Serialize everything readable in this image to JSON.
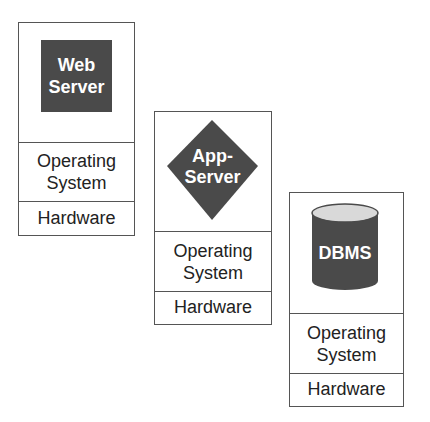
{
  "colors": {
    "component_fill": "#4a4a4a",
    "cylinder_top": "#d9d9d9",
    "border": "#555555",
    "text": "#222222",
    "label_text": "#ffffff"
  },
  "stacks": [
    {
      "component": {
        "shape": "square",
        "line1": "Web",
        "line2": "Server"
      },
      "os_label": "Operating\nSystem",
      "hw_label": "Hardware"
    },
    {
      "component": {
        "shape": "diamond",
        "line1": "App-",
        "line2": "Server"
      },
      "os_label": "Operating\nSystem",
      "hw_label": "Hardware"
    },
    {
      "component": {
        "shape": "cylinder",
        "line1": "DBMS"
      },
      "os_label": "Operating\nSystem",
      "hw_label": "Hardware"
    }
  ]
}
